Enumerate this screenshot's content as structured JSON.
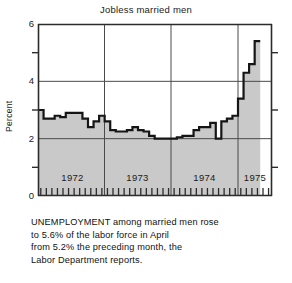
{
  "chart_data": {
    "type": "area",
    "title": "Jobless married men",
    "xlabel": "",
    "ylabel": "Percent",
    "ylim": [
      0,
      6
    ],
    "yticks": [
      0,
      2,
      4,
      6
    ],
    "yticks_minor": [
      1,
      3,
      5
    ],
    "grid": true,
    "grid_h_values": [
      2,
      4
    ],
    "grid_v_labels": [
      "1972",
      "1973",
      "1974",
      "1975"
    ],
    "legend": "none",
    "x_tick_interval": "monthly",
    "x_range": [
      "1972-01",
      "1975-04"
    ],
    "series": [
      {
        "name": "Unemployment rate, married men",
        "units": "percent of labor force",
        "x": [
          "1972-01",
          "1972-02",
          "1972-03",
          "1972-04",
          "1972-05",
          "1972-06",
          "1972-07",
          "1972-08",
          "1972-09",
          "1972-10",
          "1972-11",
          "1972-12",
          "1973-01",
          "1973-02",
          "1973-03",
          "1973-04",
          "1973-05",
          "1973-06",
          "1973-07",
          "1973-08",
          "1973-09",
          "1973-10",
          "1973-11",
          "1973-12",
          "1974-01",
          "1974-02",
          "1974-03",
          "1974-04",
          "1974-05",
          "1974-06",
          "1974-07",
          "1974-08",
          "1974-09",
          "1974-10",
          "1974-11",
          "1974-12",
          "1975-01",
          "1975-02",
          "1975-03",
          "1975-04"
        ],
        "values": [
          3.0,
          2.7,
          2.7,
          2.8,
          2.75,
          2.9,
          2.9,
          2.9,
          2.7,
          2.4,
          2.6,
          2.8,
          2.6,
          2.3,
          2.25,
          2.25,
          2.3,
          2.4,
          2.3,
          2.25,
          2.1,
          2.0,
          2.0,
          2.0,
          2.0,
          2.05,
          2.1,
          2.1,
          2.3,
          2.4,
          2.4,
          2.55,
          2.0,
          2.6,
          2.7,
          2.8,
          3.4,
          4.3,
          4.6,
          5.4
        ]
      }
    ],
    "annotations": [
      {
        "label": "April 1975 value",
        "value": 5.6
      },
      {
        "label": "March 1975 value",
        "value": 5.2
      }
    ],
    "colors": {
      "line": "#151515",
      "fill": "#c9c9c9",
      "axis": "#333333",
      "grid": "#4a4a4a",
      "background": "#ffffff"
    }
  },
  "caption": {
    "lines": [
      "UNEMPLOYMENT among married men rose",
      "to 5.6% of the labor force in April",
      "from 5.2% the preceding month, the",
      "Labor Department reports."
    ]
  },
  "ytick_labels": [
    "6",
    "4",
    "2",
    "0"
  ],
  "year_labels": [
    "1972",
    "1973",
    "1974",
    "1975"
  ]
}
